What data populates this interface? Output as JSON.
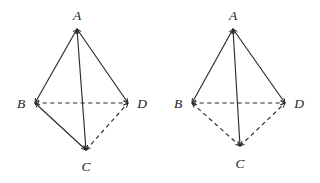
{
  "figure": {
    "background_color": "#ffffff",
    "line_color": "#2b2b2b",
    "label_color": "#1d1d1d",
    "canvas": {
      "width": 320,
      "height": 183
    }
  },
  "diagrams": [
    {
      "name": "left-tetrahedron",
      "vertices": [
        {
          "id": "A",
          "label": "A",
          "x": 77,
          "y": 29,
          "label_x": 77,
          "label_y": 20
        },
        {
          "id": "B",
          "label": "B",
          "x": 35,
          "y": 103,
          "label_x": 21,
          "label_y": 108
        },
        {
          "id": "C",
          "label": "C",
          "x": 86,
          "y": 150,
          "label_x": 86,
          "label_y": 171
        },
        {
          "id": "D",
          "label": "D",
          "x": 128,
          "y": 103,
          "label_x": 142,
          "label_y": 108
        }
      ],
      "edges": [
        {
          "from": "A",
          "to": "B",
          "style": "solid"
        },
        {
          "from": "A",
          "to": "D",
          "style": "solid"
        },
        {
          "from": "A",
          "to": "C",
          "style": "solid"
        },
        {
          "from": "B",
          "to": "C",
          "style": "solid"
        },
        {
          "from": "B",
          "to": "D",
          "style": "dashed"
        },
        {
          "from": "C",
          "to": "D",
          "style": "dashed"
        }
      ]
    },
    {
      "name": "right-tetrahedron",
      "vertices": [
        {
          "id": "A",
          "label": "A",
          "x": 233,
          "y": 29,
          "label_x": 233,
          "label_y": 20
        },
        {
          "id": "B",
          "label": "B",
          "x": 192,
          "y": 103,
          "label_x": 178,
          "label_y": 108
        },
        {
          "id": "C",
          "label": "C",
          "x": 240,
          "y": 146,
          "label_x": 240,
          "label_y": 168
        },
        {
          "id": "D",
          "label": "D",
          "x": 285,
          "y": 103,
          "label_x": 299,
          "label_y": 108
        }
      ],
      "edges": [
        {
          "from": "A",
          "to": "B",
          "style": "solid"
        },
        {
          "from": "A",
          "to": "D",
          "style": "solid"
        },
        {
          "from": "A",
          "to": "C",
          "style": "solid"
        },
        {
          "from": "B",
          "to": "C",
          "style": "dashed"
        },
        {
          "from": "B",
          "to": "D",
          "style": "dashed"
        },
        {
          "from": "C",
          "to": "D",
          "style": "dashed"
        }
      ]
    }
  ]
}
